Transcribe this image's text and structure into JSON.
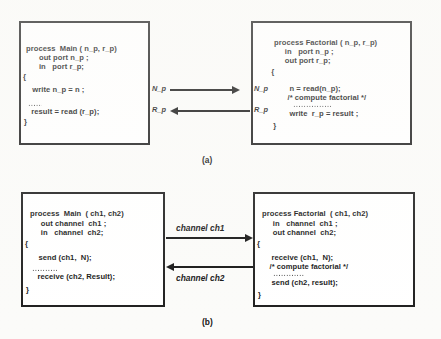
{
  "figure": {
    "background_color": "#fbfbf9",
    "ink_color": "#101010",
    "panels": [
      {
        "id": "a",
        "caption": "(a)",
        "style": "port-based (shared ports)",
        "left_box": {
          "title": "process  Main ( n_p, r_p)",
          "lines": [
            "process  Main ( n_p, r_p)",
            "      out port n_p ;",
            "      in   port r_p;",
            "{",
            "  write n_p = n ;",
            "",
            "  result = read (r_p);",
            "}"
          ]
        },
        "right_box": {
          "title": "process Factorial ( n_p, r_p)",
          "lines": [
            "process Factorial ( n_p, r_p)",
            "     in   port n_p ;",
            "     out port r_p;",
            "  {",
            "   n = read(n_p);",
            "   /* compute factorial */",
            "",
            "   write  r_p = result ;",
            "  }"
          ]
        },
        "connections": [
          {
            "label_left": "N_p",
            "label_right": "N_p",
            "direction": "left-to-right",
            "name": "n-port-connection"
          },
          {
            "label_left": "R_p",
            "label_right": "R_p",
            "direction": "right-to-left",
            "name": "r-port-connection"
          }
        ]
      },
      {
        "id": "b",
        "caption": "(b)",
        "style": "channel-based (message passing)",
        "left_box": {
          "title": "process  Main  ( ch1, ch2)",
          "lines": [
            "process  Main  ( ch1, ch2)",
            "     out channel  ch1 ;",
            "     in   channel  ch2;",
            "{",
            "   send (ch1,  N);",
            "",
            "   receive (ch2, Result);",
            "}"
          ]
        },
        "right_box": {
          "title": "process Factorial  ( ch1, ch2)",
          "lines": [
            "process Factorial  ( ch1, ch2)",
            "     in   channel  ch1 ;",
            "     out channel  ch2;",
            "{",
            "   receive (ch1,  N);",
            "   /* compute factorial */",
            "",
            "   send (ch2, result);",
            "}"
          ]
        },
        "connections": [
          {
            "label": "channel ch1",
            "direction": "left-to-right",
            "name": "channel-ch1-connection"
          },
          {
            "label": "channel ch2",
            "direction": "right-to-left",
            "name": "channel-ch2-connection"
          }
        ]
      }
    ]
  }
}
